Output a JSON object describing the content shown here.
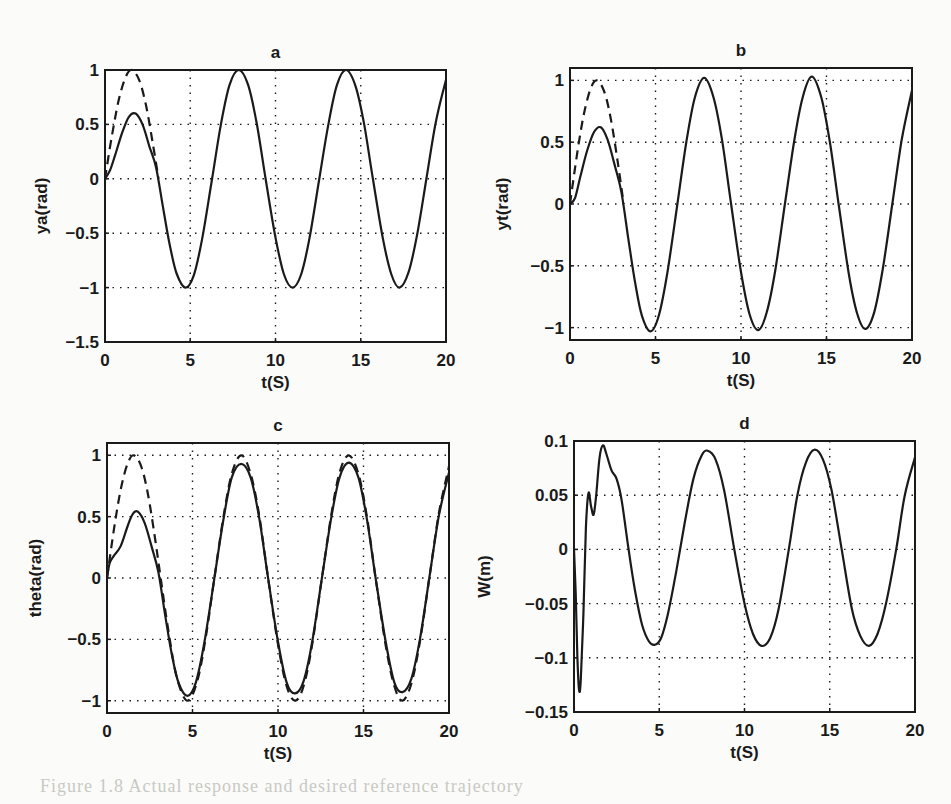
{
  "figure": {
    "background": "#fbfbf9",
    "line_color": "#1a1a1a",
    "caption_fragment": "Figure 1.8 Actual response and desired reference trajectory"
  },
  "chart_data": [
    {
      "id": "a",
      "type": "line",
      "title": "a",
      "xlabel": "t(S)",
      "ylabel": "ya(rad)",
      "xlim": [
        0,
        20
      ],
      "ylim": [
        -1.5,
        1
      ],
      "xticks": [
        0,
        5,
        10,
        15,
        20
      ],
      "yticks": [
        -1.5,
        -1,
        -0.5,
        0,
        0.5,
        1
      ],
      "ytick_labels": [
        "−1.5",
        "−1",
        "−0.5",
        "0",
        "0.5",
        "1"
      ],
      "grid": true,
      "box_px": {
        "left": 105,
        "top": 70,
        "right": 446,
        "bottom": 342
      },
      "series": [
        {
          "name": "desired",
          "style": "dashed",
          "x": [
            0,
            0.4,
            0.8,
            1.2,
            1.57,
            2.0,
            2.4,
            2.8,
            3.14
          ],
          "y": [
            0,
            0.39,
            0.72,
            0.93,
            1.0,
            0.91,
            0.68,
            0.33,
            0.0
          ]
        },
        {
          "name": "actual",
          "style": "solid",
          "x": [
            0,
            0.3,
            0.6,
            1.0,
            1.4,
            1.8,
            2.2,
            2.6,
            3.0,
            3.4,
            3.8,
            4.2,
            4.71,
            5.2,
            5.7,
            6.28,
            6.8,
            7.3,
            7.85,
            8.4,
            8.9,
            9.42,
            10.0,
            10.5,
            11.0,
            11.5,
            12.0,
            12.57,
            13.1,
            13.6,
            14.14,
            14.7,
            15.2,
            15.71,
            16.3,
            16.8,
            17.28,
            17.8,
            18.3,
            18.85,
            19.4,
            20.0
          ],
          "y": [
            0,
            0.08,
            0.22,
            0.42,
            0.57,
            0.6,
            0.5,
            0.3,
            0.1,
            -0.26,
            -0.61,
            -0.87,
            -1.0,
            -0.89,
            -0.55,
            0.0,
            0.5,
            0.86,
            1.0,
            0.86,
            0.51,
            0.0,
            -0.54,
            -0.88,
            -1.0,
            -0.88,
            -0.54,
            0.0,
            0.5,
            0.86,
            1.0,
            0.85,
            0.5,
            0.0,
            -0.55,
            -0.88,
            -1.0,
            -0.86,
            -0.52,
            0.0,
            0.52,
            0.91
          ]
        }
      ]
    },
    {
      "id": "b",
      "type": "line",
      "title": "b",
      "xlabel": "t(S)",
      "ylabel": "yt(rad)",
      "xlim": [
        0,
        20
      ],
      "ylim": [
        -1.1,
        1.1
      ],
      "xticks": [
        0,
        5,
        10,
        15,
        20
      ],
      "yticks": [
        -1,
        -0.5,
        0,
        0.5,
        1
      ],
      "ytick_labels": [
        "−1",
        "−0.5",
        "0",
        "0.5",
        "1"
      ],
      "grid": true,
      "box_px": {
        "left": 570,
        "top": 68,
        "right": 912,
        "bottom": 340
      },
      "series": [
        {
          "name": "desired",
          "style": "dashed",
          "x": [
            0,
            0.4,
            0.8,
            1.2,
            1.57,
            2.0,
            2.4,
            2.8,
            3.14
          ],
          "y": [
            0,
            0.39,
            0.72,
            0.93,
            1.0,
            0.91,
            0.68,
            0.33,
            0.0
          ]
        },
        {
          "name": "actual",
          "style": "solid",
          "x": [
            0,
            0.3,
            0.6,
            1.0,
            1.4,
            1.8,
            2.2,
            2.6,
            3.0,
            3.4,
            3.8,
            4.2,
            4.71,
            5.2,
            5.7,
            6.28,
            6.8,
            7.3,
            7.85,
            8.4,
            8.9,
            9.42,
            10.0,
            10.5,
            11.0,
            11.5,
            12.0,
            12.57,
            13.1,
            13.6,
            14.14,
            14.7,
            15.2,
            15.71,
            16.3,
            16.8,
            17.28,
            17.8,
            18.3,
            18.85,
            19.4,
            20.0
          ],
          "y": [
            0,
            0.05,
            0.22,
            0.43,
            0.58,
            0.62,
            0.52,
            0.32,
            0.1,
            -0.27,
            -0.63,
            -0.9,
            -1.03,
            -0.9,
            -0.55,
            0.0,
            0.5,
            0.86,
            1.02,
            0.86,
            0.51,
            0.0,
            -0.55,
            -0.89,
            -1.02,
            -0.88,
            -0.54,
            0.0,
            0.5,
            0.86,
            1.03,
            0.86,
            0.5,
            0.0,
            -0.56,
            -0.89,
            -1.01,
            -0.87,
            -0.52,
            0.0,
            0.52,
            0.92
          ]
        }
      ]
    },
    {
      "id": "c",
      "type": "line",
      "title": "c",
      "xlabel": "t(S)",
      "ylabel": "theta(rad)",
      "xlim": [
        0,
        20
      ],
      "ylim": [
        -1.1,
        1.1
      ],
      "xticks": [
        0,
        5,
        10,
        15,
        20
      ],
      "yticks": [
        -1,
        -0.5,
        0,
        0.5,
        1
      ],
      "ytick_labels": [
        "−1",
        "−0.5",
        "0",
        "0.5",
        "1"
      ],
      "grid": true,
      "box_px": {
        "left": 107,
        "top": 443,
        "right": 449,
        "bottom": 713
      },
      "series": [
        {
          "name": "desired",
          "style": "dashed",
          "x": [
            0,
            0.4,
            0.8,
            1.2,
            1.57,
            2.0,
            2.4,
            2.8,
            3.14,
            3.6,
            4.1,
            4.71,
            5.3,
            5.8,
            6.28,
            6.8,
            7.3,
            7.85,
            8.4,
            8.9,
            9.42,
            10.0,
            10.5,
            11.0,
            11.5,
            12.0,
            12.57,
            13.1,
            13.6,
            14.14,
            14.7,
            15.2,
            15.71,
            16.3,
            16.8,
            17.28,
            17.8,
            18.3,
            18.85,
            19.4,
            20.0
          ],
          "y": [
            0,
            0.39,
            0.72,
            0.93,
            1.0,
            0.91,
            0.68,
            0.33,
            0.0,
            -0.44,
            -0.82,
            -1.0,
            -0.83,
            -0.46,
            0.0,
            0.49,
            0.85,
            1.0,
            0.85,
            0.51,
            0.0,
            -0.54,
            -0.88,
            -1.0,
            -0.88,
            -0.54,
            0.0,
            0.5,
            0.86,
            1.0,
            0.85,
            0.5,
            0.0,
            -0.55,
            -0.88,
            -1.0,
            -0.86,
            -0.52,
            0.0,
            0.52,
            0.91
          ]
        },
        {
          "name": "actual",
          "style": "solid",
          "x": [
            0,
            0.15,
            0.4,
            0.8,
            1.2,
            1.5,
            1.8,
            2.2,
            2.6,
            3.0,
            3.4,
            3.8,
            4.2,
            4.71,
            5.2,
            5.7,
            6.28,
            6.8,
            7.3,
            7.85,
            8.4,
            8.9,
            9.42,
            10.0,
            10.5,
            11.0,
            11.5,
            12.0,
            12.57,
            13.1,
            13.6,
            14.14,
            14.7,
            15.2,
            15.71,
            16.3,
            16.8,
            17.28,
            17.8,
            18.3,
            18.85,
            19.4,
            20.0
          ],
          "y": [
            0,
            0.12,
            0.18,
            0.26,
            0.42,
            0.52,
            0.54,
            0.45,
            0.26,
            0.05,
            -0.3,
            -0.63,
            -0.86,
            -0.96,
            -0.85,
            -0.52,
            0.0,
            0.47,
            0.82,
            0.93,
            0.82,
            0.49,
            0.0,
            -0.52,
            -0.85,
            -0.94,
            -0.84,
            -0.52,
            0.0,
            0.48,
            0.82,
            0.94,
            0.82,
            0.48,
            0.0,
            -0.52,
            -0.85,
            -0.93,
            -0.82,
            -0.5,
            0.0,
            0.5,
            0.86
          ]
        }
      ]
    },
    {
      "id": "d",
      "type": "line",
      "title": "d",
      "xlabel": "t(S)",
      "ylabel": "W(m)",
      "xlim": [
        0,
        20
      ],
      "ylim": [
        -0.15,
        0.1
      ],
      "xticks": [
        0,
        5,
        10,
        15,
        20
      ],
      "yticks": [
        -0.15,
        -0.1,
        -0.05,
        0,
        0.05,
        0.1
      ],
      "ytick_labels": [
        "−0.15",
        "−0.1",
        "−0.05",
        "0",
        "0.05",
        "0.1"
      ],
      "grid": true,
      "box_px": {
        "left": 574,
        "top": 441,
        "right": 915,
        "bottom": 712
      },
      "series": [
        {
          "name": "deflection",
          "style": "solid",
          "x": [
            0,
            0.1,
            0.2,
            0.3,
            0.4,
            0.55,
            0.7,
            0.85,
            1.0,
            1.15,
            1.3,
            1.5,
            1.7,
            1.9,
            2.2,
            2.5,
            2.8,
            3.2,
            3.6,
            4.0,
            4.4,
            4.75,
            5.1,
            5.5,
            6.0,
            6.5,
            7.0,
            7.5,
            7.85,
            8.3,
            8.8,
            9.4,
            10.0,
            10.5,
            11.0,
            11.5,
            12.0,
            12.6,
            13.1,
            13.6,
            14.1,
            14.6,
            15.1,
            15.7,
            16.3,
            16.8,
            17.3,
            17.8,
            18.3,
            18.9,
            19.4,
            20.0
          ],
          "y": [
            0,
            -0.04,
            -0.1,
            -0.13,
            -0.12,
            -0.06,
            0.02,
            0.052,
            0.04,
            0.032,
            0.05,
            0.085,
            0.096,
            0.088,
            0.073,
            0.065,
            0.045,
            0.0,
            -0.04,
            -0.07,
            -0.085,
            -0.088,
            -0.082,
            -0.06,
            -0.02,
            0.025,
            0.065,
            0.087,
            0.091,
            0.083,
            0.055,
            0.0,
            -0.05,
            -0.078,
            -0.089,
            -0.082,
            -0.055,
            0.0,
            0.05,
            0.08,
            0.092,
            0.083,
            0.055,
            0.0,
            -0.055,
            -0.08,
            -0.089,
            -0.078,
            -0.05,
            0.0,
            0.05,
            0.085
          ]
        }
      ]
    }
  ]
}
